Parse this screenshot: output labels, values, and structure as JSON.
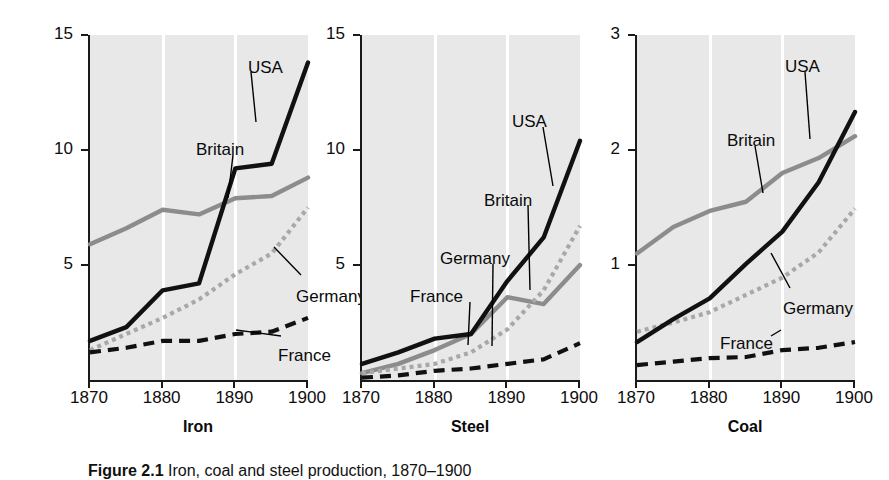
{
  "figure": {
    "ylabel": "Millions of metric tons",
    "caption_bold": "Figure 2.1",
    "caption_rest": "Iron, coal and steel production, 1870–1900"
  },
  "series_names": {
    "usa": "USA",
    "britain": "Britain",
    "germany": "Germany",
    "france": "France"
  },
  "colors": {
    "usa": "#111111",
    "britain": "#8c8c8c",
    "germany": "#a8a8a8",
    "france": "#111111",
    "plot_background": "#e8e8e8",
    "gridline": "#ffffff",
    "axis": "#1a1a1a"
  },
  "chart_data": [
    {
      "type": "line",
      "title": "Iron",
      "xlabel": "",
      "ylabel": "Millions of metric tons",
      "x": [
        1870,
        1875,
        1880,
        1885,
        1890,
        1895,
        1900
      ],
      "xlim": [
        1870,
        1900
      ],
      "ylim": [
        0,
        15
      ],
      "yticks": [
        5,
        10,
        15
      ],
      "xticks": [
        1870,
        1880,
        1890,
        1900
      ],
      "grid": "vertical-white-at-1880-1890",
      "legend": "inline-annotations",
      "series": [
        {
          "name": "USA",
          "values": [
            1.7,
            2.3,
            3.9,
            4.2,
            9.2,
            9.4,
            13.8
          ]
        },
        {
          "name": "Britain",
          "values": [
            5.9,
            6.6,
            7.4,
            7.2,
            7.9,
            8.0,
            8.8
          ]
        },
        {
          "name": "Germany",
          "values": [
            1.3,
            2.0,
            2.7,
            3.5,
            4.6,
            5.5,
            7.5
          ]
        },
        {
          "name": "France",
          "values": [
            1.2,
            1.4,
            1.7,
            1.7,
            2.0,
            2.1,
            2.7
          ]
        }
      ]
    },
    {
      "type": "line",
      "title": "Steel",
      "xlabel": "",
      "ylabel": "Millions of metric tons",
      "x": [
        1870,
        1875,
        1880,
        1885,
        1890,
        1895,
        1900
      ],
      "xlim": [
        1870,
        1900
      ],
      "ylim": [
        0,
        15
      ],
      "yticks": [
        5,
        10,
        15
      ],
      "xticks": [
        1870,
        1880,
        1890,
        1900
      ],
      "grid": "vertical-white-at-1880-1890",
      "legend": "inline-annotations",
      "series": [
        {
          "name": "USA",
          "values": [
            0.7,
            1.2,
            1.8,
            2.0,
            4.3,
            6.2,
            10.4
          ]
        },
        {
          "name": "Britain",
          "values": [
            0.3,
            0.7,
            1.3,
            2.0,
            3.6,
            3.3,
            5.0
          ]
        },
        {
          "name": "Germany",
          "values": [
            0.3,
            0.5,
            0.7,
            1.2,
            2.2,
            3.9,
            6.7
          ]
        },
        {
          "name": "France",
          "values": [
            0.1,
            0.2,
            0.4,
            0.5,
            0.7,
            0.9,
            1.6
          ]
        }
      ]
    },
    {
      "type": "line",
      "title": "Coal",
      "xlabel": "",
      "ylabel": "Millions of metric tons",
      "x": [
        1870,
        1875,
        1880,
        1885,
        1890,
        1895,
        1900
      ],
      "xlim": [
        1870,
        1900
      ],
      "ylim": [
        0,
        3
      ],
      "yticks": [
        1,
        2,
        3
      ],
      "xticks": [
        1870,
        1880,
        1890,
        1900
      ],
      "grid": "vertical-white-at-1880-1890",
      "legend": "inline-annotations",
      "series": [
        {
          "name": "USA",
          "values": [
            0.33,
            0.53,
            0.71,
            1.01,
            1.29,
            1.72,
            2.33
          ]
        },
        {
          "name": "Britain",
          "values": [
            1.1,
            1.33,
            1.47,
            1.55,
            1.8,
            1.93,
            2.12
          ]
        },
        {
          "name": "Germany",
          "values": [
            0.42,
            0.5,
            0.59,
            0.74,
            0.89,
            1.11,
            1.49
          ]
        },
        {
          "name": "France",
          "values": [
            0.13,
            0.16,
            0.19,
            0.2,
            0.26,
            0.28,
            0.33
          ]
        }
      ]
    }
  ],
  "panels": [
    {
      "title": "Iron",
      "ytick_labels": [
        "15",
        "10",
        "5"
      ],
      "xtick_labels": [
        "1870",
        "1880",
        "1890",
        "1900"
      ],
      "annotations": [
        {
          "name": "USA",
          "x": 160,
          "y": 58
        },
        {
          "name": "Britain",
          "x": 108,
          "y": 140
        },
        {
          "name": "Germany",
          "x": 208,
          "y": 287
        },
        {
          "name": "France",
          "x": 190,
          "y": 346
        }
      ]
    },
    {
      "title": "Steel",
      "ytick_labels": [
        "15",
        "10",
        "5"
      ],
      "xtick_labels": [
        "1870",
        "1880",
        "1890",
        "1900"
      ],
      "annotations": [
        {
          "name": "USA",
          "x": 152,
          "y": 112
        },
        {
          "name": "Britain",
          "x": 124,
          "y": 191
        },
        {
          "name": "Germany",
          "x": 80,
          "y": 249
        },
        {
          "name": "France",
          "x": 50,
          "y": 287
        }
      ]
    },
    {
      "title": "Coal",
      "ytick_labels": [
        "3",
        "2",
        "1"
      ],
      "xtick_labels": [
        "1870",
        "1880",
        "1890",
        "1900"
      ],
      "annotations": [
        {
          "name": "USA",
          "x": 150,
          "y": 57
        },
        {
          "name": "Britain",
          "x": 92,
          "y": 131
        },
        {
          "name": "Germany",
          "x": 148,
          "y": 299
        },
        {
          "name": "France",
          "x": 85,
          "y": 334
        }
      ]
    }
  ]
}
